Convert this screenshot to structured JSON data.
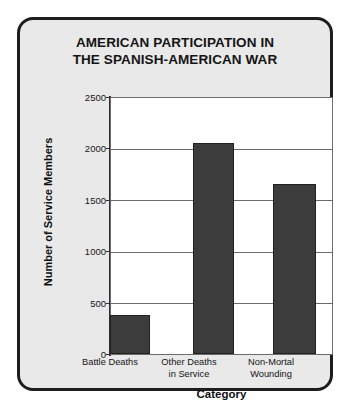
{
  "chart_data": {
    "type": "bar",
    "title": "AMERICAN PARTICIPATION IN THE SPANISH-AMERICAN WAR",
    "title_lines": [
      "AMERICAN PARTICIPATION IN",
      "THE SPANISH-AMERICAN WAR"
    ],
    "categories": [
      "Battle Deaths",
      "Other Deaths in Service",
      "Non-Mortal Wounding"
    ],
    "category_lines": [
      [
        "Battle Deaths"
      ],
      [
        "Other Deaths",
        "in Service"
      ],
      [
        "Non-Mortal",
        "Wounding"
      ]
    ],
    "values": [
      385,
      2061,
      1662
    ],
    "xlabel": "Category",
    "ylabel": "Number of Service Members",
    "ylim": [
      0,
      2500
    ],
    "yticks": [
      0,
      500,
      1000,
      1500,
      2000,
      2500
    ],
    "ytick_labels": [
      "0",
      "500",
      "1000",
      "1500",
      "2000",
      "2500"
    ],
    "grid": "horizontal",
    "legend": "none",
    "bar_color": "#3c3c3c",
    "plot_background": "#ffffff",
    "panel_background": "#e9e9e9",
    "frame_color": "#1d1d1d",
    "axis_color": "#2e2e2e"
  }
}
